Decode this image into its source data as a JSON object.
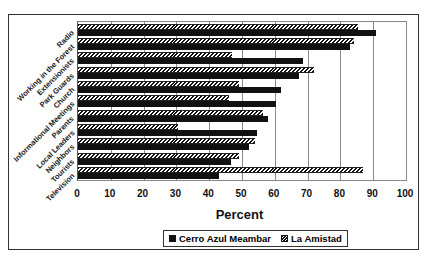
{
  "chart_data": {
    "type": "bar",
    "orientation": "horizontal",
    "title": "",
    "xlabel": "Percent",
    "ylabel": "",
    "xlim": [
      0,
      100
    ],
    "xticks": [
      0,
      10,
      20,
      30,
      40,
      50,
      60,
      70,
      80,
      90,
      100
    ],
    "grid": true,
    "legend_position": "bottom",
    "categories": [
      "Radio",
      "Working in the Forest",
      "Extensionists",
      "Park Guards",
      "Church",
      "Informational Meetings",
      "Parents",
      "Local Leaders",
      "Neighbors",
      "Tourists",
      "Television"
    ],
    "series": [
      {
        "name": "Cerro Azul Meambar",
        "pattern": "solid",
        "color": "#111111",
        "values": [
          91,
          83,
          68.5,
          67.5,
          62,
          60.5,
          58,
          54.5,
          52,
          46.5,
          43
        ]
      },
      {
        "name": "La Amistad",
        "pattern": "hatched",
        "color": "#111111",
        "values": [
          85.5,
          84,
          47,
          72,
          49,
          46,
          56.5,
          30.5,
          54,
          49,
          87
        ]
      }
    ]
  },
  "axis": {
    "x_ticks": [
      "0",
      "10",
      "20",
      "30",
      "40",
      "50",
      "60",
      "70",
      "80",
      "90",
      "100"
    ],
    "x_label": "Percent"
  },
  "legend": {
    "items": [
      {
        "label": "Cerro Azul Meambar",
        "swatch": "solid"
      },
      {
        "label": "La Amistad",
        "swatch": "hatched"
      }
    ]
  }
}
